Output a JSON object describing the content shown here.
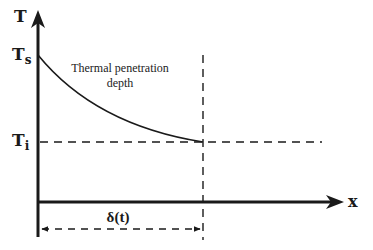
{
  "diagram": {
    "axes": {
      "y_label": "T",
      "x_label": "x"
    },
    "levels": {
      "surface_label_main": "T",
      "surface_label_sub": "s",
      "initial_label_main": "T",
      "initial_label_sub": "i"
    },
    "annotation": {
      "line1": "Thermal penetration",
      "line2": "depth"
    },
    "dimension": {
      "label": "δ(t)"
    },
    "colors": {
      "ink": "#1a1a1a",
      "background": "#ffffff"
    }
  }
}
